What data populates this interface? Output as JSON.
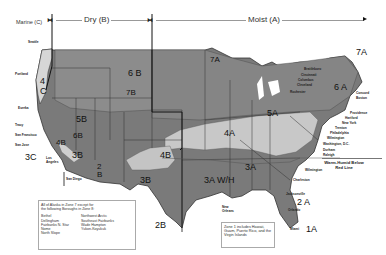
{
  "header": {
    "marine_label": "Marine (C)",
    "dry_label": "Dry (B)",
    "moist_label": "Moist (A)"
  },
  "zones": {
    "z4c": "4\nC",
    "z6b": "6 B",
    "z7b": "7B",
    "z5b": "5B",
    "z6b_sw": "6B",
    "z4b_ca": "4B",
    "z3b_ca": "3B",
    "z3c": "3C",
    "z2b_az": "2\nB",
    "z4b_nm": "4B",
    "z3b_tx": "3B",
    "z2b_tx": "2B",
    "z7a_mn": "7A",
    "z7a_me": "7A",
    "z6a": "6 A",
    "z5a": "5A",
    "z4a": "4A",
    "z3a": "3A",
    "z3awh": "3A W/H",
    "z2a": "2 A",
    "z1a": "1A"
  },
  "cities_west": [
    "Seattle",
    "Portland",
    "Eureka",
    "Tracy",
    "San Francisco",
    "San Jose",
    "Los Angeles",
    "San Diego"
  ],
  "cities_east": [
    "Brattleboro",
    "Cincinnati",
    "Columbus",
    "Cleveland",
    "Rochester",
    "Concord",
    "Boston",
    "Providence",
    "Hartford",
    "New York",
    "Trenton",
    "Philadelphia",
    "Wilmington",
    "Washington, D.C.",
    "Durham",
    "Raleigh",
    "Wilmington",
    "Charleston",
    "Jacksonville",
    "Orlando",
    "Miami",
    "New Orleans"
  ],
  "warm_humid_label": "Warm-Humid Below\nRed Line",
  "alaska_note": {
    "intro": "All of Alaska in Zone 7 except for the following Boroughs in Zone 8:",
    "col1": [
      "Bethel",
      "Dellingham",
      "Fairbanks N. Star",
      "Nome",
      "North Slope"
    ],
    "col2": [
      "Northwest Arctic",
      "Southeast Fairbanks",
      "Wade Hampton",
      "Yukon-Koyukuk"
    ]
  },
  "zone1_note": {
    "text": "Zone 1 includes Hawaii, Guam, Puerto Rico, and the Virgin Islands"
  },
  "colors": {
    "dark_zone": "#6e6e6e",
    "mid_zone": "#8a8a8a",
    "light_zone": "#c8c8c8",
    "marine_zone": "#d6d6d6",
    "border": "#333333"
  }
}
